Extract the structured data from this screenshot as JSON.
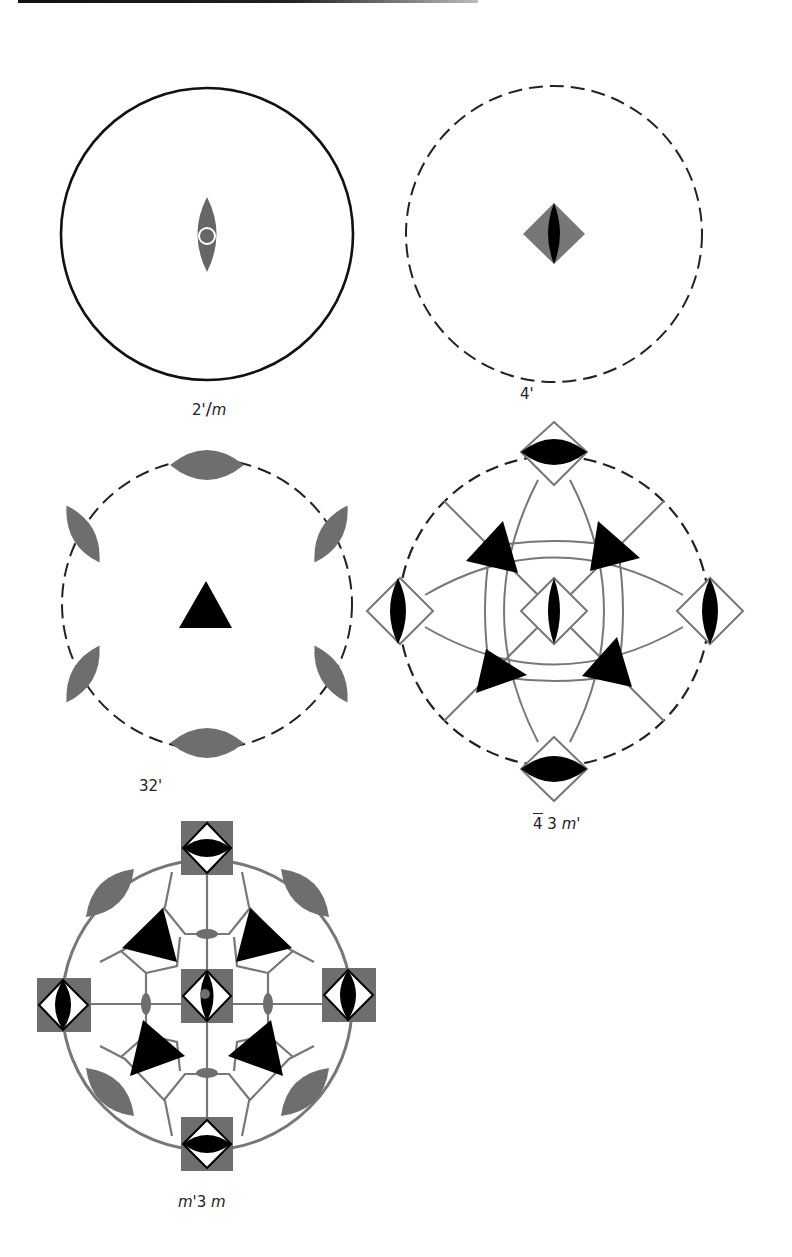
{
  "figure": {
    "panels": [
      {
        "id": "p1",
        "label": "2'/m",
        "label_parts": {
          "a": "2'",
          "b": "/",
          "c": "m"
        },
        "circle": "solid",
        "center": [
          207,
          234
        ],
        "radius": 146,
        "symbols": [
          {
            "type": "lens-vertical",
            "fill": "#666666",
            "inner": "white-ring"
          }
        ]
      },
      {
        "id": "p2",
        "label": "4'",
        "circle": "dashed",
        "center": [
          554,
          234
        ],
        "radius": 148,
        "symbols": [
          {
            "type": "diamond",
            "fill": "#777777",
            "inner": "black-lens"
          }
        ]
      },
      {
        "id": "p3",
        "label": "32'",
        "circle": "dashed",
        "center": [
          207,
          604
        ],
        "radius": 145,
        "symbols": [
          {
            "type": "triangle",
            "fill": "#000000"
          },
          {
            "type": "grey-lens",
            "count": 6
          }
        ]
      },
      {
        "id": "p4",
        "label": "4̅ 3 m'",
        "label_parts": {
          "a": "4",
          "b": "3",
          "c": "m'"
        },
        "circle": "dashed",
        "center": [
          554,
          611
        ],
        "radius": 155,
        "symbols": [
          {
            "type": "diamond-outline-black-lens",
            "count": 5
          },
          {
            "type": "triangle",
            "count": 4
          }
        ]
      },
      {
        "id": "p5",
        "label": "m'3 m",
        "label_parts": {
          "a": "m'",
          "b": "3",
          "c": "m"
        },
        "circle": "grey",
        "center": [
          207,
          1005
        ],
        "radius": 145,
        "symbols": [
          {
            "type": "grey-square-diamond-lens",
            "count": 5
          },
          {
            "type": "grey-lens",
            "count": 4
          },
          {
            "type": "triangle",
            "count": 4
          },
          {
            "type": "small-grey-oval",
            "count": 4
          }
        ]
      }
    ]
  },
  "colors": {
    "ink": "#111111",
    "grey": "#6e6e6e",
    "line_grey": "#777777"
  }
}
